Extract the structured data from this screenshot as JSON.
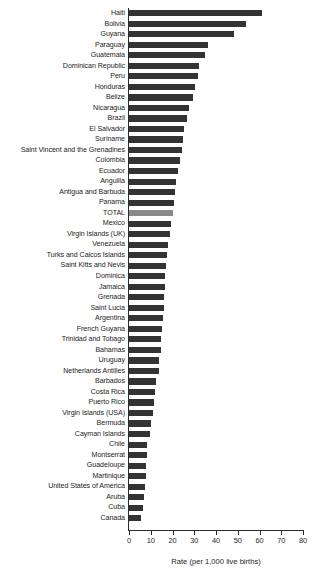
{
  "chart_data": {
    "type": "bar",
    "orientation": "horizontal",
    "title": "",
    "xlabel": "Rate (per 1,000 live births)",
    "ylabel": "",
    "xlim": [
      0,
      80
    ],
    "xticks": [
      0,
      10,
      20,
      30,
      40,
      50,
      60,
      70,
      80
    ],
    "grid": false,
    "legend": null,
    "bar_color": "#333333",
    "highlight_color": "#8a8a8a",
    "highlight_category": "TOTAL",
    "categories": [
      "Haiti",
      "Bolivia",
      "Guyana",
      "Paraguay",
      "Guatemala",
      "Dominican Republic",
      "Peru",
      "Honduras",
      "Belize",
      "Nicaragua",
      "Brazil",
      "El Salvador",
      "Suriname",
      "Saint Vincent and the Grenadines",
      "Colombia",
      "Ecuador",
      "Anguilla",
      "Antigua and Barbuda",
      "Panama",
      "TOTAL",
      "Mexico",
      "Virgin Islands (UK)",
      "Venezuela",
      "Turks and Caicos Islands",
      "Saint Kitts and Nevis",
      "Dominica",
      "Jamaica",
      "Grenada",
      "Saint Lucia",
      "Argentina",
      "French Guyana",
      "Trinidad and Tobago",
      "Bahamas",
      "Uruguay",
      "Netherlands Antilles",
      "Barbados",
      "Costa Rica",
      "Puerto Rico",
      "Virgin Islands (USA)",
      "Bermuda",
      "Cayman Islands",
      "Chile",
      "Montserrat",
      "Guadeloupe",
      "Martinique",
      "United States of America",
      "Aruba",
      "Cuba",
      "Canada"
    ],
    "values": [
      61.0,
      54.0,
      48.5,
      36.5,
      35.0,
      32.0,
      31.5,
      30.5,
      29.5,
      27.5,
      26.5,
      25.5,
      25.0,
      24.5,
      23.5,
      22.5,
      21.5,
      21.0,
      20.5,
      20.0,
      19.5,
      19.0,
      18.0,
      17.5,
      17.0,
      16.5,
      16.5,
      16.0,
      16.0,
      15.5,
      15.0,
      14.5,
      14.5,
      14.0,
      14.0,
      12.5,
      12.0,
      11.5,
      11.0,
      10.0,
      9.5,
      8.5,
      8.5,
      8.0,
      8.0,
      7.5,
      7.0,
      6.5,
      5.5
    ]
  }
}
